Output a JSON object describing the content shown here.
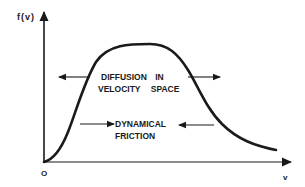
{
  "diagram": {
    "y_axis_label": "f(v)",
    "x_axis_label": "v",
    "origin_label": "O",
    "upper_annotation": {
      "line1": "DIFFUSION IN",
      "line2": "VELOCITY SPACE",
      "arrows": [
        "left",
        "right"
      ]
    },
    "lower_annotation": {
      "line1": "DYNAMICAL",
      "line2": "FRICTION",
      "arrows": [
        "right",
        "left"
      ]
    },
    "curve": "Skewed bell-shaped velocity distribution f(v), rising steeply from origin, peaking, then decaying toward high v",
    "colors": {
      "ink": "#1a1a1a",
      "background": "#ffffff"
    }
  }
}
